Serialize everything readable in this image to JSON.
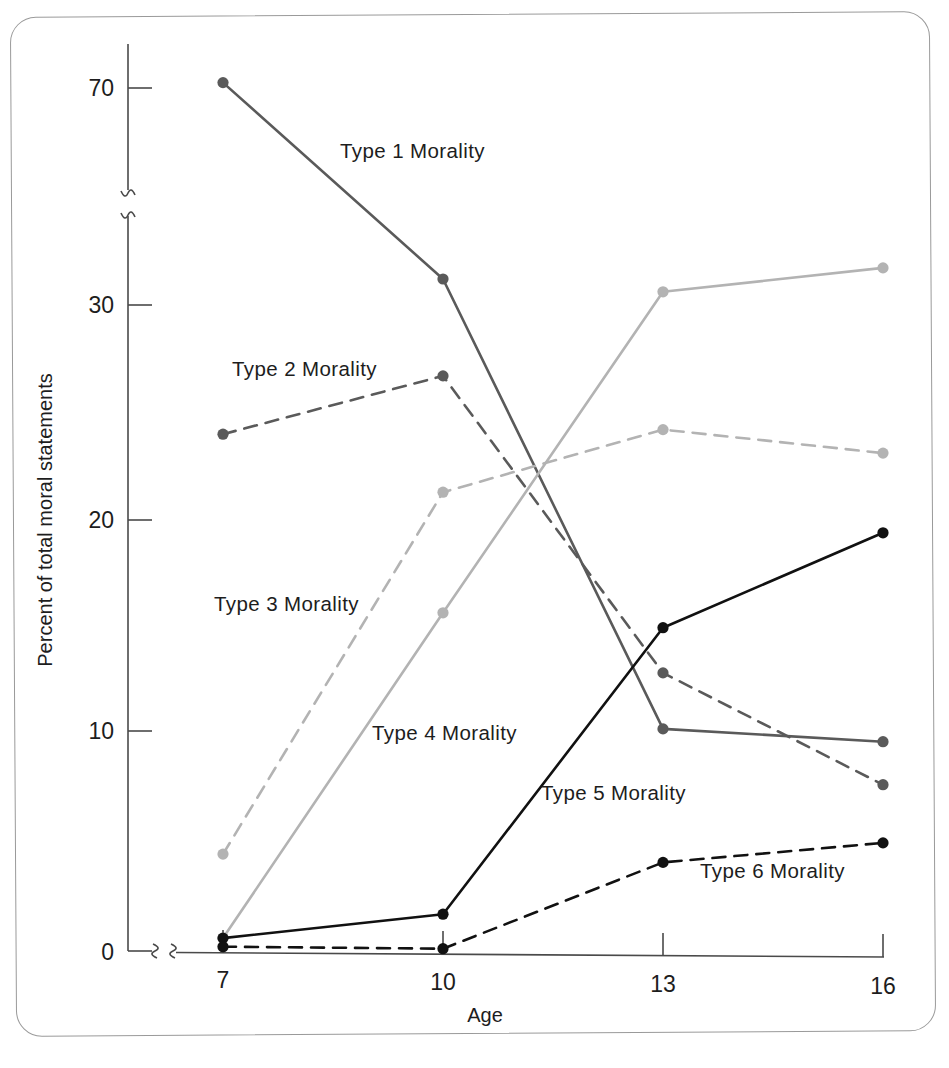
{
  "figure": {
    "caption_present": false,
    "background_color": "#ffffff",
    "frame_color": "#9a9a9a"
  },
  "chart_data": {
    "type": "line",
    "title": "",
    "xlabel": "Age",
    "ylabel": "Percent of total moral statements",
    "x": [
      7,
      10,
      13,
      16
    ],
    "categories": [
      "7",
      "10",
      "13",
      "16"
    ],
    "xtick_labels": [
      "7",
      "10",
      "13",
      "16"
    ],
    "ytick_labels": [
      "0",
      "10",
      "20",
      "30",
      "70"
    ],
    "ytick_values": [
      0,
      10,
      20,
      30,
      70
    ],
    "ylim": [
      0,
      72
    ],
    "axis_break_y": true,
    "axis_break_x": true,
    "grid": false,
    "legend": "inline-labels",
    "series": [
      {
        "name": "Type 1 Morality",
        "label": "Type 1 Morality",
        "values": [
          71.0,
          31.3,
          10.5,
          10.0
        ],
        "color": "#5a5a5a",
        "style": "solid",
        "marker": "circle"
      },
      {
        "name": "Type 2 Morality",
        "label": "Type 2 Morality",
        "values": [
          24.0,
          26.8,
          13.1,
          8.0
        ],
        "color": "#5a5a5a",
        "style": "dashed",
        "marker": "circle"
      },
      {
        "name": "Type 3 Morality",
        "label": "Type 3 Morality",
        "values": [
          4.5,
          21.4,
          24.4,
          23.4
        ],
        "color": "#b3b3b3",
        "style": "dashed",
        "marker": "circle"
      },
      {
        "name": "Type 4 Morality",
        "label": "Type 4 Morality",
        "values": [
          0.6,
          15.8,
          30.8,
          32.0
        ],
        "color": "#b3b3b3",
        "style": "solid",
        "marker": "circle"
      },
      {
        "name": "Type 5 Morality",
        "label": "Type 5 Morality",
        "values": [
          0.6,
          1.8,
          15.2,
          19.7
        ],
        "color": "#111111",
        "style": "solid",
        "marker": "circle"
      },
      {
        "name": "Type 6 Morality",
        "label": "Type 6 Morality",
        "values": [
          0.2,
          0.2,
          4.3,
          5.3
        ],
        "color": "#111111",
        "style": "dashed",
        "marker": "circle"
      }
    ],
    "annotations": [
      {
        "text": "Type 1 Morality",
        "x": 340,
        "y": 158
      },
      {
        "text": "Type 2 Morality",
        "x": 232,
        "y": 376
      },
      {
        "text": "Type 3 Morality",
        "x": 214,
        "y": 611
      },
      {
        "text": "Type 4 Morality",
        "x": 372,
        "y": 740
      },
      {
        "text": "Type 5 Morality",
        "x": 541,
        "y": 800
      },
      {
        "text": "Type 6 Morality",
        "x": 700,
        "y": 878
      }
    ]
  }
}
